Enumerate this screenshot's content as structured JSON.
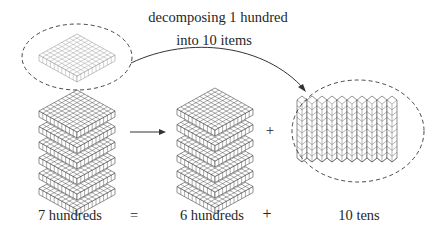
{
  "annotation": {
    "line1": "decomposing 1 hundred",
    "line2": "into 10 items"
  },
  "equation": {
    "left": "7 hundreds",
    "equals": "=",
    "middle": "6 hundreds",
    "plus": "+",
    "right": "10 tens"
  },
  "diagram": {
    "operator_plus": "+",
    "left_stack_flats": 6,
    "extracted_flats": 1,
    "middle_stack_flats": 6,
    "ten_rods": 10,
    "cubes_per_rod": 10,
    "colors": {
      "line": "#444444",
      "light_line": "#9a9a9a",
      "dashed": "#333333",
      "text": "#262626"
    }
  }
}
